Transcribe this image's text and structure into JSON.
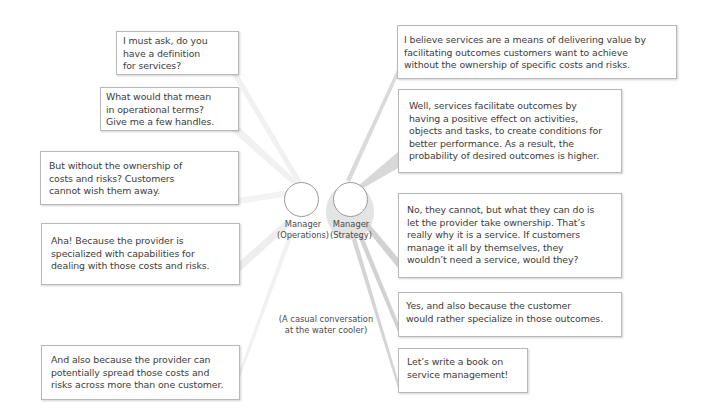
{
  "participants": {
    "operations": {
      "label": "Manager\n(Operations)"
    },
    "strategy": {
      "label": "Manager\n(Strategy)"
    }
  },
  "caption": "(A casual conversation\nat the water cooler)",
  "colors": {
    "box_border": "#b8b8b8",
    "beam_operations": "#efefef",
    "beam_strategy": "#d6d6d6",
    "text": "#3c3c3c"
  },
  "operations_bubbles": [
    {
      "text": "I must ask, do you\nhave a definition\nfor services?"
    },
    {
      "text": "What would that mean\nin operational terms?\nGive me a few handles."
    },
    {
      "text": "But without the ownership of\ncosts and risks? Customers\ncannot wish them away."
    },
    {
      "text": "Aha! Because the provider is\nspecialized with capabilities for\ndealing with those costs and risks."
    },
    {
      "text": "And also because the provider can\npotentially spread those costs and\nrisks across more than one customer."
    }
  ],
  "strategy_bubbles": [
    {
      "text": "I believe services are a means of delivering value by\nfacilitating outcomes customers want to achieve\nwithout the ownership of specific costs and risks."
    },
    {
      "text": "Well, services facilitate outcomes by\nhaving a positive effect on activities,\nobjects and tasks, to create conditions for\nbetter performance. As a result, the\nprobability of desired outcomes is higher."
    },
    {
      "text": "No, they cannot, but what they can do is\nlet the provider take ownership. That’s\nreally why it is a service. If customers\nmanage it all by themselves, they\nwouldn’t need a service, would they?"
    },
    {
      "text": "Yes, and also because the customer\nwould rather specialize in those outcomes."
    },
    {
      "text": "Let’s write a book on\nservice management!"
    }
  ]
}
